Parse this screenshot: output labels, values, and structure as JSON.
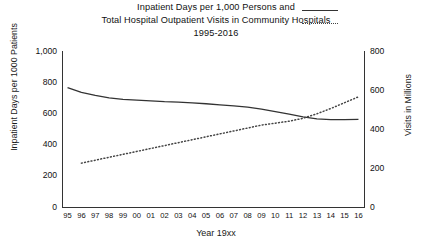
{
  "title": {
    "line1": "Inpatient Days per 1,000 Persons and",
    "line2": "Total Hospital Outpatient Visits in Community Hospitals",
    "line3": "1995-2016"
  },
  "legend": {
    "solid_name": "inpatient-days-line-sample",
    "dotted_name": "outpatient-visits-line-sample"
  },
  "chart_data": {
    "type": "line",
    "title": "Inpatient Days per 1,000 Persons and Total Hospital Outpatient Visits in Community Hospitals 1995-2016",
    "xlabel": "Year 19xx",
    "ylabel": "Inpatient Days per 1000 Patients",
    "y2label": "Visits in Millions",
    "grid": false,
    "legend_position": "top-right",
    "categories": [
      "95",
      "96",
      "97",
      "98",
      "99",
      "00",
      "01",
      "02",
      "03",
      "04",
      "05",
      "06",
      "07",
      "08",
      "09",
      "10",
      "11",
      "12",
      "13",
      "14",
      "15",
      "16"
    ],
    "xtick_labels": [
      "95",
      "96",
      "97",
      "98",
      "99",
      "00",
      "01",
      "02",
      "03",
      "04",
      "05",
      "06",
      "07",
      "08",
      "09",
      "10",
      "11",
      "12",
      "13",
      "14",
      "15",
      "16"
    ],
    "ylim": [
      0,
      1000
    ],
    "yticks": [
      "0",
      "200",
      "400",
      "600",
      "800",
      "1,000"
    ],
    "ytick_values": [
      0,
      200,
      400,
      600,
      800,
      1000
    ],
    "y2lim": [
      0,
      800
    ],
    "y2ticks": [
      "0",
      "200",
      "400",
      "600",
      "800"
    ],
    "y2tick_values": [
      0,
      200,
      400,
      600,
      800
    ],
    "series": [
      {
        "name": "Inpatient Days per 1,000 Persons",
        "style": "solid",
        "axis": "left",
        "color": "#333333",
        "x": [
          "95",
          "96",
          "97",
          "98",
          "99",
          "00",
          "01",
          "02",
          "03",
          "04",
          "05",
          "06",
          "07",
          "08",
          "09",
          "10",
          "11",
          "12",
          "13",
          "14",
          "15",
          "16"
        ],
        "values": [
          765,
          735,
          715,
          700,
          690,
          685,
          680,
          675,
          672,
          668,
          662,
          655,
          648,
          640,
          628,
          612,
          595,
          578,
          565,
          560,
          560,
          562
        ]
      },
      {
        "name": "Total Hospital Outpatient Visits in Community Hospitals",
        "style": "dotted",
        "axis": "right",
        "color": "#444444",
        "x": [
          "96",
          "97",
          "98",
          "99",
          "00",
          "01",
          "02",
          "03",
          "04",
          "05",
          "06",
          "07",
          "08",
          "09",
          "10",
          "11",
          "12",
          "13",
          "14",
          "15",
          "16"
        ],
        "values": [
          225,
          240,
          255,
          270,
          285,
          300,
          315,
          330,
          345,
          360,
          375,
          390,
          405,
          420,
          430,
          440,
          455,
          478,
          505,
          535,
          565
        ]
      }
    ]
  }
}
